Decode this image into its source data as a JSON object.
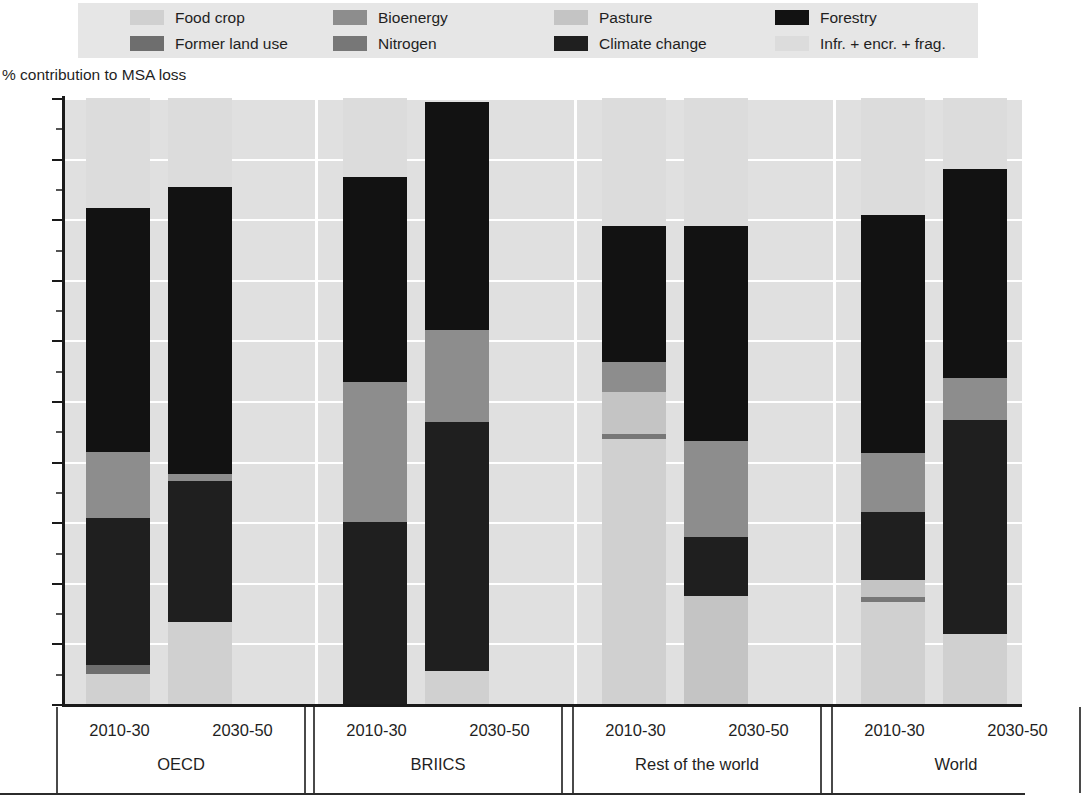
{
  "axis_title": "% contribution to MSA loss",
  "legend": {
    "rows": [
      [
        {
          "label": "Food crop",
          "key": "food_crop",
          "color": "#d0d0d0"
        },
        {
          "label": "Bioenergy",
          "key": "bioenergy",
          "color": "#8d8d8d"
        },
        {
          "label": "Pasture",
          "key": "pasture",
          "color": "#c4c4c4"
        },
        {
          "label": "Forestry",
          "key": "forestry",
          "color": "#121212"
        }
      ],
      [
        {
          "label": "Former land use",
          "key": "former_land_use",
          "color": "#6e6e6e"
        },
        {
          "label": "Nitrogen",
          "key": "nitrogen",
          "color": "#777777"
        },
        {
          "label": "Climate change",
          "key": "climate_change",
          "color": "#1f1f1f"
        },
        {
          "label": "Infr. + encr. + frag.",
          "key": "infr_encr_frag",
          "color": "#dcdcdc"
        }
      ]
    ]
  },
  "colors": {
    "food_crop": "#d0d0d0",
    "bioenergy": "#8d8d8d",
    "pasture": "#c4c4c4",
    "forestry": "#121212",
    "former_land_use": "#6e6e6e",
    "nitrogen": "#777777",
    "climate_change": "#1f1f1f",
    "infr_encr_frag": "#dcdcdc",
    "plot_background": "#e0e0e0",
    "gridline": "#ffffff",
    "axis": "#1a1a1a",
    "legend_background": "#e6e6e6"
  },
  "chart_data": {
    "type": "bar",
    "title": "",
    "subtitle": "",
    "xlabel": "",
    "ylabel": "% contribution to MSA loss",
    "ylim": [
      0,
      100
    ],
    "yticks": [
      0,
      10,
      20,
      30,
      40,
      50,
      60,
      70,
      80,
      90,
      100
    ],
    "ytick_labels": [
      "0",
      "10",
      "20",
      "30",
      "40",
      "50",
      "60",
      "70",
      "80",
      "90",
      "100"
    ],
    "grid": true,
    "legend_position": "top",
    "stacked": true,
    "stack_order_bottom_to_top": [
      "food_crop",
      "former_land_use",
      "climate_change",
      "nitrogen",
      "pasture",
      "bioenergy",
      "forestry",
      "infr_encr_frag"
    ],
    "series_names": [
      "Food crop",
      "Former land use",
      "Climate change",
      "Nitrogen",
      "Pasture",
      "Bioenergy",
      "Forestry",
      "Infr. + encr. + frag."
    ],
    "groups": [
      {
        "name": "OECD",
        "periods": [
          "2010-30",
          "2030-50"
        ],
        "bars": [
          {
            "period": "2010-30",
            "segments": [
              {
                "key": "food_crop",
                "label": "Food crop",
                "from": 0.0,
                "to": 5.0,
                "value": 5.0
              },
              {
                "key": "former_land_use",
                "label": "Former land use",
                "from": 5.0,
                "to": 6.5,
                "value": 1.5
              },
              {
                "key": "climate_change",
                "label": "Climate change",
                "from": 6.5,
                "to": 30.7,
                "value": 24.2
              },
              {
                "key": "bioenergy",
                "label": "Bioenergy",
                "from": 30.7,
                "to": 41.6,
                "value": 10.9
              },
              {
                "key": "forestry",
                "label": "Forestry",
                "from": 41.6,
                "to": 81.8,
                "value": 40.2
              },
              {
                "key": "infr_encr_frag",
                "label": "Infr. + encr. + frag.",
                "from": 81.8,
                "to": 100.0,
                "value": 18.2
              }
            ]
          },
          {
            "period": "2030-50",
            "segments": [
              {
                "key": "food_crop",
                "label": "Food crop",
                "from": 0.0,
                "to": 13.6,
                "value": 13.6
              },
              {
                "key": "climate_change",
                "label": "Climate change",
                "from": 13.6,
                "to": 36.8,
                "value": 23.2
              },
              {
                "key": "bioenergy",
                "label": "Bioenergy",
                "from": 36.8,
                "to": 38.0,
                "value": 1.2
              },
              {
                "key": "forestry",
                "label": "Forestry",
                "from": 38.0,
                "to": 85.3,
                "value": 47.3
              },
              {
                "key": "infr_encr_frag",
                "label": "Infr. + encr. + frag.",
                "from": 85.3,
                "to": 100.0,
                "value": 14.7
              }
            ]
          }
        ]
      },
      {
        "name": "BRIICS",
        "periods": [
          "2010-30",
          "2030-50"
        ],
        "bars": [
          {
            "period": "2010-30",
            "segments": [
              {
                "key": "climate_change",
                "label": "Climate change",
                "from": 0.0,
                "to": 30.0,
                "value": 30.0
              },
              {
                "key": "bioenergy",
                "label": "Bioenergy",
                "from": 30.0,
                "to": 53.1,
                "value": 23.1
              },
              {
                "key": "forestry",
                "label": "Forestry",
                "from": 53.1,
                "to": 86.9,
                "value": 33.8
              },
              {
                "key": "infr_encr_frag",
                "label": "Infr. + encr. + frag.",
                "from": 86.9,
                "to": 100.0,
                "value": 13.1
              }
            ]
          },
          {
            "period": "2030-50",
            "segments": [
              {
                "key": "food_crop",
                "label": "Food crop",
                "from": 0.0,
                "to": 5.4,
                "value": 5.4
              },
              {
                "key": "climate_change",
                "label": "Climate change",
                "from": 5.4,
                "to": 46.6,
                "value": 41.2
              },
              {
                "key": "bioenergy",
                "label": "Bioenergy",
                "from": 46.6,
                "to": 61.7,
                "value": 15.1
              },
              {
                "key": "forestry",
                "label": "Forestry",
                "from": 61.7,
                "to": 99.3,
                "value": 37.6
              }
            ]
          }
        ]
      },
      {
        "name": "Rest of the world",
        "periods": [
          "2010-30",
          "2030-50"
        ],
        "bars": [
          {
            "period": "2010-30",
            "segments": [
              {
                "key": "food_crop",
                "label": "Food crop",
                "from": 0.0,
                "to": 43.7,
                "value": 43.7
              },
              {
                "key": "nitrogen",
                "label": "Nitrogen",
                "from": 43.7,
                "to": 44.6,
                "value": 0.9
              },
              {
                "key": "pasture",
                "label": "Pasture",
                "from": 44.6,
                "to": 51.5,
                "value": 6.9
              },
              {
                "key": "bioenergy",
                "label": "Bioenergy",
                "from": 51.5,
                "to": 56.5,
                "value": 5.0
              },
              {
                "key": "forestry",
                "label": "Forestry",
                "from": 56.5,
                "to": 78.8,
                "value": 22.3
              },
              {
                "key": "infr_encr_frag",
                "label": "Infr. + encr. + frag.",
                "from": 78.8,
                "to": 100.0,
                "value": 21.2
              }
            ]
          },
          {
            "period": "2030-50",
            "segments": [
              {
                "key": "pasture",
                "label": "Pasture",
                "from": 0.0,
                "to": 17.9,
                "value": 17.9
              },
              {
                "key": "climate_change",
                "label": "Climate change",
                "from": 17.9,
                "to": 27.5,
                "value": 9.6
              },
              {
                "key": "bioenergy",
                "label": "Bioenergy",
                "from": 27.5,
                "to": 43.4,
                "value": 15.9
              },
              {
                "key": "forestry",
                "label": "Forestry",
                "from": 43.4,
                "to": 78.9,
                "value": 35.5
              },
              {
                "key": "infr_encr_frag",
                "label": "Infr. + encr. + frag.",
                "from": 78.9,
                "to": 100.0,
                "value": 21.1
              }
            ]
          }
        ]
      },
      {
        "name": "World",
        "periods": [
          "2010-30",
          "2030-50"
        ],
        "bars": [
          {
            "period": "2010-30",
            "segments": [
              {
                "key": "food_crop",
                "label": "Food crop",
                "from": 0.0,
                "to": 16.8,
                "value": 16.8
              },
              {
                "key": "nitrogen",
                "label": "Nitrogen",
                "from": 16.8,
                "to": 17.7,
                "value": 0.9
              },
              {
                "key": "pasture",
                "label": "Pasture",
                "from": 17.7,
                "to": 20.5,
                "value": 2.8
              },
              {
                "key": "climate_change",
                "label": "Climate change",
                "from": 20.5,
                "to": 31.7,
                "value": 11.2
              },
              {
                "key": "bioenergy",
                "label": "Bioenergy",
                "from": 31.7,
                "to": 41.5,
                "value": 9.8
              },
              {
                "key": "forestry",
                "label": "Forestry",
                "from": 41.5,
                "to": 80.7,
                "value": 39.2
              },
              {
                "key": "infr_encr_frag",
                "label": "Infr. + encr. + frag.",
                "from": 80.7,
                "to": 100.0,
                "value": 19.3
              }
            ]
          },
          {
            "period": "2030-50",
            "segments": [
              {
                "key": "food_crop",
                "label": "Food crop",
                "from": 0.0,
                "to": 11.5,
                "value": 11.5
              },
              {
                "key": "climate_change",
                "label": "Climate change",
                "from": 11.5,
                "to": 46.9,
                "value": 35.4
              },
              {
                "key": "bioenergy",
                "label": "Bioenergy",
                "from": 46.9,
                "to": 53.8,
                "value": 6.9
              },
              {
                "key": "forestry",
                "label": "Forestry",
                "from": 53.8,
                "to": 88.3,
                "value": 34.5
              },
              {
                "key": "infr_encr_frag",
                "label": "Infr. + encr. + frag.",
                "from": 88.3,
                "to": 100.0,
                "value": 11.7
              }
            ]
          }
        ]
      }
    ]
  }
}
